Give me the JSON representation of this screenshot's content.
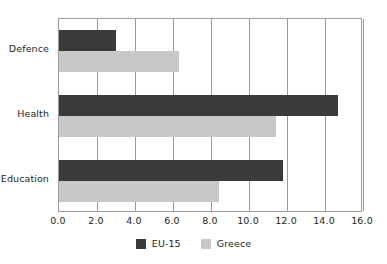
{
  "chart_data": {
    "type": "bar",
    "orientation": "horizontal",
    "title": "",
    "subtitle": "",
    "xlabel": "",
    "ylabel": "",
    "categories": [
      "Defence",
      "Health",
      "Education"
    ],
    "series": [
      {
        "name": "EU-15",
        "color": "#3a3a3a",
        "values": [
          3.0,
          14.7,
          11.8
        ]
      },
      {
        "name": "Greece",
        "color": "#c8c8c8",
        "values": [
          6.3,
          11.4,
          8.4
        ]
      }
    ],
    "xlim": [
      0.0,
      16.0
    ],
    "xticks": [
      0.0,
      2.0,
      4.0,
      6.0,
      8.0,
      10.0,
      12.0,
      14.0,
      16.0
    ],
    "xtick_labels": [
      "0.0",
      "2.0",
      "4.0",
      "6.0",
      "8.0",
      "10.0",
      "12.0",
      "14.0",
      "16.0"
    ],
    "grid": "vertical",
    "legend_position": "bottom",
    "legend_entries": [
      "EU-15",
      "Greece"
    ],
    "annotations": []
  },
  "legend": {
    "items": [
      {
        "label": "EU-15"
      },
      {
        "label": "Greece"
      }
    ]
  },
  "colors": {
    "series_eu15": "#3a3a3a",
    "series_greece": "#c8c8c8",
    "axis": "#9a9a9a",
    "text": "#231f20",
    "background": "#ffffff"
  }
}
